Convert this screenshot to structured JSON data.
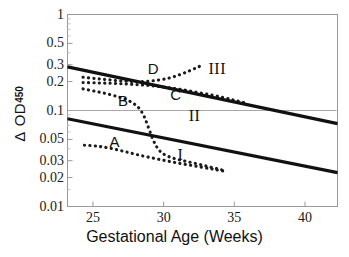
{
  "chart_data": {
    "type": "line",
    "title": "",
    "xlabel": "Gestational Age (Weeks)",
    "ylabel": "Δ OD450",
    "ylabel_parts": {
      "delta": "Δ",
      "od": "OD",
      "subscript": "450"
    },
    "yscale": "log",
    "xlim": [
      23.2,
      42.3
    ],
    "ylim": [
      0.01,
      1.0
    ],
    "grid": false,
    "legend_position": "inline-annotations",
    "xticks": [
      25,
      30,
      35,
      40
    ],
    "xtick_labels": [
      "25",
      "30",
      "35",
      "40"
    ],
    "yticks": [
      1,
      0.5,
      0.3,
      0.2,
      0.1,
      0.05,
      0.03,
      0.02,
      0.01
    ],
    "ytick_labels": [
      "1",
      "0.5",
      "0.3",
      "0.2",
      "0.1",
      "0.05",
      "0.03",
      "0.02",
      "0.01"
    ],
    "zone_boundaries": [
      {
        "name": "upper-liley-line",
        "label": "III",
        "style": "solid",
        "points": [
          [
            23.2,
            0.285
          ],
          [
            42.3,
            0.073
          ]
        ]
      },
      {
        "name": "lower-liley-line",
        "label": "I",
        "style": "solid",
        "points": [
          [
            23.2,
            0.082
          ],
          [
            42.3,
            0.0225
          ]
        ]
      }
    ],
    "reference_line": {
      "name": "horizontal-0.1-line",
      "value": 0.1,
      "style": "thin-solid"
    },
    "series": [
      {
        "name": "A",
        "label": "A",
        "style": "dotted",
        "label_x": 26.6,
        "label_y": 0.0475,
        "points": [
          [
            24.4,
            0.0435
          ],
          [
            25.3,
            0.0425
          ],
          [
            26.2,
            0.0405
          ],
          [
            27.2,
            0.0375
          ],
          [
            28.2,
            0.0345
          ],
          [
            29.3,
            0.0318
          ],
          [
            30.4,
            0.0295
          ],
          [
            31.5,
            0.0275
          ],
          [
            32.6,
            0.0258
          ],
          [
            33.6,
            0.0243
          ],
          [
            34.4,
            0.0232
          ]
        ]
      },
      {
        "name": "B",
        "label": "B",
        "style": "dotted",
        "label_x": 27.2,
        "label_y": 0.125,
        "points": [
          [
            24.3,
            0.168
          ],
          [
            25.2,
            0.158
          ],
          [
            26.1,
            0.148
          ],
          [
            26.9,
            0.137
          ],
          [
            27.6,
            0.125
          ],
          [
            28.2,
            0.108
          ],
          [
            28.6,
            0.088
          ],
          [
            28.9,
            0.068
          ],
          [
            29.2,
            0.052
          ],
          [
            29.5,
            0.042
          ],
          [
            29.9,
            0.036
          ],
          [
            30.5,
            0.0325
          ],
          [
            31.3,
            0.0302
          ],
          [
            32.2,
            0.0282
          ],
          [
            33.1,
            0.0262
          ],
          [
            33.9,
            0.0245
          ],
          [
            34.4,
            0.0235
          ]
        ]
      },
      {
        "name": "C",
        "label": "C",
        "style": "dotted",
        "label_x": 30.9,
        "label_y": 0.145,
        "points": [
          [
            24.3,
            0.196
          ],
          [
            25.3,
            0.194
          ],
          [
            26.3,
            0.192
          ],
          [
            27.3,
            0.189
          ],
          [
            28.3,
            0.185
          ],
          [
            29.3,
            0.18
          ],
          [
            30.3,
            0.173
          ],
          [
            31.3,
            0.165
          ],
          [
            32.3,
            0.155
          ],
          [
            33.3,
            0.146
          ],
          [
            34.2,
            0.137
          ],
          [
            35.0,
            0.128
          ],
          [
            35.7,
            0.121
          ]
        ]
      },
      {
        "name": "D",
        "label": "D",
        "style": "dotted",
        "label_x": 29.3,
        "label_y": 0.272,
        "points": [
          [
            24.3,
            0.222
          ],
          [
            25.2,
            0.215
          ],
          [
            26.1,
            0.209
          ],
          [
            27.0,
            0.203
          ],
          [
            27.9,
            0.2
          ],
          [
            28.8,
            0.201
          ],
          [
            29.7,
            0.208
          ],
          [
            30.5,
            0.22
          ],
          [
            31.2,
            0.238
          ],
          [
            31.8,
            0.258
          ],
          [
            32.3,
            0.278
          ],
          [
            32.7,
            0.295
          ]
        ]
      }
    ],
    "zone_labels": [
      {
        "text": "III",
        "x": 33.6,
        "y": 0.272
      },
      {
        "text": "II",
        "x": 32.2,
        "y": 0.088
      },
      {
        "text": "I",
        "x": 31.4,
        "y": 0.0345
      }
    ]
  }
}
